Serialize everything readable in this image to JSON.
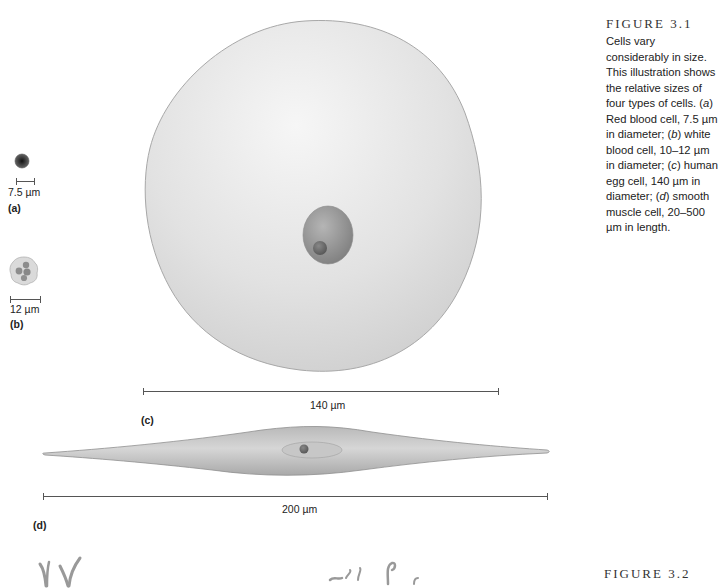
{
  "figure_3_1": {
    "title": "FIGURE 3.1",
    "caption_parts": {
      "intro": "Cells vary considerably in size. This illustration shows the relative sizes of four types of cells. (",
      "a": "a",
      "a_text": ") Red blood cell, 7.5 µm in diameter; (",
      "b": "b",
      "b_text": ") white blood cell, 10–12 µm in diameter; (",
      "c": "c",
      "c_text": ") human egg cell, 140 µm in diameter; (",
      "d": "d",
      "d_text": ") smooth muscle cell, 20–500 µm in length."
    },
    "panels": {
      "a": {
        "label": "(a)",
        "scale": "7.5 µm",
        "name": "Red blood cell"
      },
      "b": {
        "label": "(b)",
        "scale": "12 µm",
        "name": "White blood cell"
      },
      "c": {
        "label": "(c)",
        "scale": "140 µm",
        "name": "Human egg cell"
      },
      "d": {
        "label": "(d)",
        "scale": "200 µm",
        "name": "Smooth muscle cell"
      }
    }
  },
  "figure_3_2": {
    "title": "FIGURE 3.2"
  },
  "colors": {
    "cell_fill": "#d8d8d8",
    "cell_outline": "#9a9a9a",
    "nucleus": "#8c8c8c",
    "rbc": "#3a3a3a",
    "scalebar": "#555555"
  }
}
